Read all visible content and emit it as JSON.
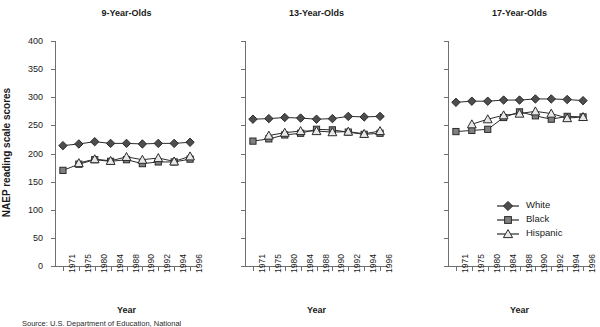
{
  "chart_data": {
    "type": "line",
    "panels": [
      {
        "title": "9-Year-Olds",
        "xlabel": "Year",
        "ylabel": "NAEP reading scale scores",
        "categories": [
          "1971",
          "1975",
          "1980",
          "1984",
          "1988",
          "1990",
          "1992",
          "1994",
          "1996"
        ],
        "series": [
          {
            "name": "White",
            "values": [
              214,
              217,
              221,
              218,
              218,
              217,
              218,
              218,
              220
            ]
          },
          {
            "name": "Black",
            "values": [
              170,
              181,
              189,
              186,
              189,
              182,
              185,
              185,
              190
            ]
          },
          {
            "name": "Hispanic",
            "values": [
              null,
              183,
              190,
              187,
              194,
              189,
              192,
              186,
              195
            ]
          }
        ]
      },
      {
        "title": "13-Year-Olds",
        "xlabel": "Year",
        "ylabel": "NAEP reading scale scores",
        "categories": [
          "1971",
          "1975",
          "1980",
          "1984",
          "1988",
          "1990",
          "1992",
          "1994",
          "1996"
        ],
        "series": [
          {
            "name": "White",
            "values": [
              261,
              262,
              264,
              263,
              261,
              262,
              266,
              265,
              266
            ]
          },
          {
            "name": "Black",
            "values": [
              222,
              226,
              233,
              236,
              243,
              242,
              238,
              234,
              236
            ]
          },
          {
            "name": "Hispanic",
            "values": [
              null,
              232,
              237,
              240,
              240,
              238,
              239,
              235,
              240
            ]
          }
        ]
      },
      {
        "title": "17-Year-Olds",
        "xlabel": "Year",
        "ylabel": "NAEP reading scale scores",
        "categories": [
          "1971",
          "1975",
          "1980",
          "1984",
          "1988",
          "1990",
          "1992",
          "1994",
          "1996"
        ],
        "series": [
          {
            "name": "White",
            "values": [
              291,
              293,
              293,
              295,
              295,
              297,
              297,
              296,
              294
            ]
          },
          {
            "name": "Black",
            "values": [
              239,
              241,
              243,
              264,
              274,
              267,
              261,
              266,
              265
            ]
          },
          {
            "name": "Hispanic",
            "values": [
              null,
              252,
              261,
              268,
              271,
              275,
              271,
              263,
              265
            ]
          }
        ]
      }
    ],
    "yticks": [
      0,
      50,
      100,
      150,
      200,
      250,
      300,
      350,
      400
    ],
    "ylim": [
      0,
      400
    ],
    "grid": false,
    "legend": {
      "position": "bottom-right-of-third-panel",
      "entries": [
        {
          "label": "White",
          "marker": "diamond",
          "color": "#4d4d4d"
        },
        {
          "label": "Black",
          "marker": "square",
          "color": "#808080"
        },
        {
          "label": "Hispanic",
          "marker": "triangle",
          "color": "#e8e8e8"
        }
      ]
    }
  },
  "colors": {
    "line": "#2b2b2b",
    "axis": "#6f6f6f",
    "white_marker": "#4d4d4d",
    "black_marker": "#808080",
    "hispanic_marker": "#e8e8e8",
    "marker_edge": "#2b2b2b",
    "text": "#1a1a1a"
  },
  "source": {
    "note": "Source: U.S. Department of Education, National"
  }
}
